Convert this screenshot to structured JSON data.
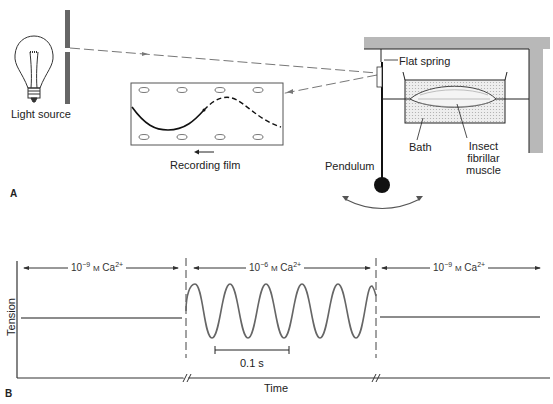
{
  "panel_a": {
    "panel_label": "A",
    "labels": {
      "light_source": "Light source",
      "recording_film": "Recording film",
      "pendulum": "Pendulum",
      "flat_spring": "Flat spring",
      "bath": "Bath",
      "muscle_line1": "Insect",
      "muscle_line2": "fibrillar",
      "muscle_line3": "muscle"
    }
  },
  "panel_b": {
    "panel_label": "B",
    "ylabel": "Tension",
    "xlabel": "Time",
    "scale_bar": "0.1 s",
    "segments": [
      {
        "exp": "10",
        "power": "−9",
        "unit": "M",
        "ion": "Ca",
        "charge": "2+"
      },
      {
        "exp": "10",
        "power": "−6",
        "unit": "M",
        "ion": "Ca",
        "charge": "2+"
      },
      {
        "exp": "10",
        "power": "−9",
        "unit": "M",
        "ion": "Ca",
        "charge": "2+"
      }
    ]
  },
  "colors": {
    "line": "#1a1a1a",
    "trace": "#555555",
    "wall": "#b5b5b5",
    "bath": "#e6e6e6"
  }
}
